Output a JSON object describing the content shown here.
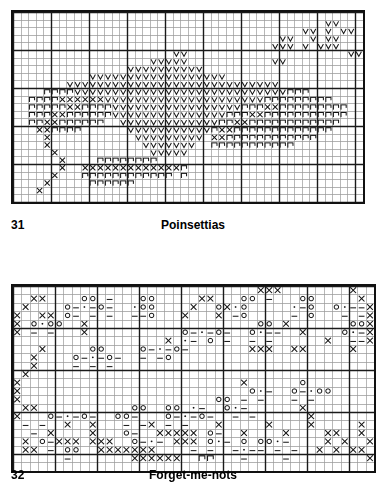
{
  "page": {
    "background": "#ffffff",
    "ink": "#111111",
    "gridline_light": "#9a9a9a",
    "gridline_heavy": "#1a1a1a"
  },
  "charts": [
    {
      "id": "poinsettias",
      "page_number": "31",
      "title": "Poinsettias",
      "grid": {
        "cols": 46,
        "rows": 25,
        "cell_px": 7.6,
        "heavy_every": 5
      },
      "legend_symbols": [
        "V",
        "dot",
        "X",
        "n"
      ],
      "chart_data": {
        "type": "heatmap",
        "title": "Poinsettias",
        "xlabel": "",
        "ylabel": "",
        "categories": [],
        "values": [],
        "symbol_key": {
          "V": "light-shade-stitch",
          "dot": "dark-filled-stitch",
          "X": "cross-stitch",
          "n": "outline-leaf-stitch",
          ".": "empty"
        },
        "rows": [
          "..............................................",
          ".........................................VV...",
          "......................................VV.V.VV.",
          "...................................VV..V.VV..",
          "..................................VVV.V.VVV..",
          ".....................VV.....................VV",
          "..................VVVVV...........VV..........",
          "...............VVVVVVVVVV.....................",
          "..........VVVVVVVVVVVVVVVVVV..................",
          ".......VVVVVVVVVVVVVVVVVVVVVVVVVVVV...........",
          "....nnnnVVVVVVVVVVVVVVVVVVVVVVVVVVVVnnn.......",
          "..nnnnXXXXXXVVVVVVVVVVVVVVVVVVVVVnnnnnnnnn....",
          "..nnnnnXXnnnnVVVVVVVVVVVVVVVVVnnnXXnnnnnnnnn..",
          "..nnnXXnnnnnnVVVVVVVVVVVVVVVnnnXXnnnnnnnnnnn..",
          "..nnXXnnnnnn..VVVVVVVVVVVVVnnXXnnnnnnnnnnnn...",
          "...XXnnnn......VVVVVVVVVVVnXXnnnnnnnnnnnnn....",
          "....X...........VVVVVVVVV.XXnnnnnnnnnnnn......",
          "....X............VVVVVVV..nnnnnnnnnnn.........",
          ".....X............VVVVV.......................",
          "......X....nnnnnnnn...........................",
          "......X..XXXXXXXXXXXXXn.......................",
          ".....X...nnnnnnnnnnnn.n.......................",
          "....X.....nnnnnn..............................",
          "...X..........................................",
          ".............................................."
        ]
      }
    },
    {
      "id": "forget-me-nots",
      "page_number": "32",
      "title": "Forget-me-nots",
      "grid": {
        "cols": 43,
        "rows": 22,
        "cell_px": 8.4,
        "heavy_every": 5
      },
      "legend_symbols": [
        "X",
        "o",
        "-",
        "."
      ],
      "chart_data": {
        "type": "heatmap",
        "title": "Forget-me-nots",
        "xlabel": "",
        "ylabel": "",
        "categories": [],
        "values": [],
        "symbol_key": {
          "X": "cross-stitch",
          "o": "open-circle-stitch",
          "-": "dash-stitch",
          "*": "small-dot-stitch",
          ".": "empty"
        },
        "rows": [
          ".............................XXX........X..",
          "..XX....oo.-...oo.....XX...oo.-...oo.....X.",
          ".X....o-*-o-..*oo....X..oX*o.....*-o..o*--X",
          "X..XX.o-.-.-..--o...X...X.-o.....-.o...-.-X",
          "X.o*oo..X....................oo.X.......ooX",
          "X.-.-...X...........o-*-o-..o*--..X....o*-X",
          "..................X.*-.o.-..-.-......X..--X",
          "...X.....oo....o-*-o-.......XXX..XX.....X..",
          "..X....o-*-o-..-.-o..........................",
          "..X....-.-.-................................",
          ".X.........................................",
          "X..........................X......o........",
          "X...........................o*-..o-*oo.....",
          "X.......................oo.-.-...-.-.......",
          ".XX...........oo..oo.*-..o*-......X........",
          "X...o-*-o-..oo-...o-*-o-..-.-......X.......",
          ".-.-..X..X...-.-X.-.-...X.....X....X.....X.",
          "..-.X....X...o-..XXXXX.o-..X....X....XX..X.",
          ".X.o-XXX.XXX..o-*-.XXX.o*-.o.oo*-....X.X..X",
          ".XX.-.oo..XXXXXXX....-.-..-*--.-.-..X.X.XX.",
          "......-.......XXXXXX..nn...-....-.........X",
          "..........................................."
        ]
      }
    }
  ]
}
